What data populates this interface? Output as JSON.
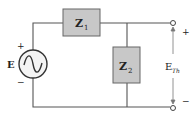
{
  "diagram": {
    "type": "circuit-schematic",
    "source": {
      "label": "E",
      "symbol": "ac-sine-source",
      "plus": "+",
      "minus": "−"
    },
    "components": [
      {
        "id": "z1",
        "label": "Z",
        "subscript": "1",
        "position": "series-top"
      },
      {
        "id": "z2",
        "label": "Z",
        "subscript": "2",
        "position": "shunt"
      }
    ],
    "output": {
      "label": "E",
      "subscript": "Th",
      "plus": "+",
      "minus": "−"
    },
    "colors": {
      "wire": "#555555",
      "box_fill": "#c8c8c8",
      "box_stroke": "#666666",
      "text": "#222222"
    }
  }
}
